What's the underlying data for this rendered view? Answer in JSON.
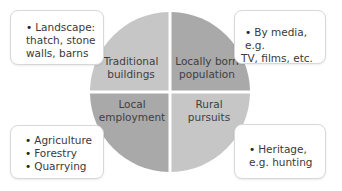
{
  "diagram": {
    "quadrants": [
      {
        "id": "top-left",
        "label_line1": "Traditional",
        "label_line2": "buildings",
        "color": "#c6c6c6"
      },
      {
        "id": "top-right",
        "label_line1": "Locally born",
        "label_line2": "population",
        "color": "#a9a9a9"
      },
      {
        "id": "bottom-left",
        "label_line1": "Local",
        "label_line2": "employment",
        "color": "#a9a9a9"
      },
      {
        "id": "bottom-right",
        "label_line1": "Rural",
        "label_line2": "pursuits",
        "color": "#c6c6c6"
      }
    ],
    "boxes": [
      {
        "id": "top-left",
        "lines": [
          "Landscape:",
          "thatch, stone",
          "walls, barns"
        ]
      },
      {
        "id": "top-right",
        "lines": [
          "By media, e.g.",
          "TV, films, etc."
        ]
      },
      {
        "id": "bottom-left",
        "items": [
          "Agriculture",
          "Forestry",
          "Quarrying"
        ]
      },
      {
        "id": "bottom-right",
        "lines": [
          "Heritage,",
          "e.g. hunting"
        ]
      }
    ]
  }
}
